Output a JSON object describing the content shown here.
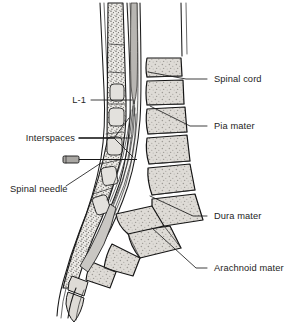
{
  "figure": {
    "width": 300,
    "height": 326,
    "background_color": "#ffffff"
  },
  "labels": {
    "spinal_cord": "Spinal cord",
    "pia_mater": "Pia mater",
    "dura_mater": "Dura mater",
    "arachnoid_mater": "Arachnoid mater",
    "l1": "L-1",
    "interspaces": "Interspaces",
    "spinal_needle": "Spinal needle"
  },
  "annotations": [
    {
      "id": "spinal-cord",
      "label": "Spinal cord",
      "side": "right",
      "text_x": 214,
      "text_y": 82,
      "leader_points": "207,79 186,79 148,72"
    },
    {
      "id": "pia-mater",
      "label": "Pia mater",
      "side": "right",
      "text_x": 214,
      "text_y": 129,
      "leader_points": "207,126 190,126 150,106"
    },
    {
      "id": "dura-mater",
      "label": "Dura mater",
      "side": "right",
      "text_x": 214,
      "text_y": 219,
      "leader_points": "207,216 193,216 150,196"
    },
    {
      "id": "arachnoid-mater",
      "label": "Arachnoid mater",
      "side": "right",
      "text_x": 214,
      "text_y": 271,
      "leader_points": "207,268 196,268 152,228"
    },
    {
      "id": "l1",
      "label": "L-1",
      "side": "left",
      "text_x": 86,
      "text_y": 103,
      "leader_points": "91,100 132,100"
    },
    {
      "id": "interspaces",
      "label": "Interspaces",
      "side": "left",
      "text_x": 75,
      "text_y": 141,
      "leader_points": "79,138 114,138 128,120"
    },
    {
      "id": "interspaces-2",
      "label": "",
      "side": "left",
      "text_x": 0,
      "text_y": 0,
      "leader_points": "79,138 114,138 130,138"
    },
    {
      "id": "interspaces-3",
      "label": "",
      "side": "left",
      "text_x": 0,
      "text_y": 0,
      "leader_points": "79,138 114,138 132,154"
    },
    {
      "id": "spinal-needle",
      "label": "Spinal needle",
      "side": "left",
      "text_x": 61,
      "text_y": 192,
      "leader_points": "66,186 100,164"
    }
  ],
  "elements": {
    "needle": {
      "name": "spinal-needle-device",
      "hub_color": "#a9a7a3",
      "hub_x": 63,
      "hub_y": 156,
      "hub_w": 16,
      "hub_h": 7
    },
    "vertebrae_count": 5,
    "sacral_segments": 4,
    "coccyx_segments": 2
  },
  "colors": {
    "bone": "#dedbd6",
    "bone_light": "#e8e6e2",
    "canal": "#f4f3f1",
    "cord": "#b8b6b2",
    "outline": "#141414",
    "text": "#242424",
    "soft_tissue": "#c9c7c3"
  }
}
